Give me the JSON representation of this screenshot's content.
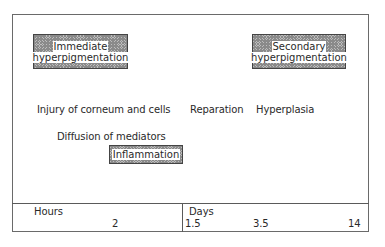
{
  "boxes": {
    "immediate": {
      "line1": "Immediate",
      "line2": "hyperpigmentation"
    },
    "secondary": {
      "line1": "Secondary",
      "line2": "hyperpigmentation"
    },
    "inflammation": {
      "line1": "Inflammation"
    }
  },
  "stages": {
    "injury": "Injury of corneum and cells",
    "reparation": "Reparation",
    "hyperplasia": "Hyperplasia",
    "diffusion": "Diffusion of mediators"
  },
  "timeline": {
    "hours": {
      "unit": "Hours",
      "ticks": [
        "2"
      ]
    },
    "days": {
      "unit": "Days",
      "ticks": [
        "1.5",
        "3.5",
        "14"
      ]
    }
  }
}
